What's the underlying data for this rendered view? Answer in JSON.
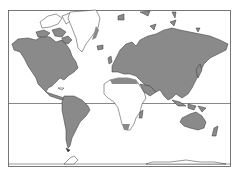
{
  "map": {
    "type": "world-map-mercator",
    "colors": {
      "background": "#ffffff",
      "land_highlight": "#8a8a8a",
      "land_plain": "#ffffff",
      "outline": "#333333",
      "frame": "#555555"
    },
    "highlighted_regions": [
      "North America",
      "South America",
      "Europe",
      "Asia",
      "Australia",
      "North Africa coast",
      "Southern Africa tip"
    ],
    "unhighlighted_regions": [
      "Greenland",
      "Africa",
      "Antarctica",
      "Arctic islands"
    ],
    "equator_line": true
  }
}
